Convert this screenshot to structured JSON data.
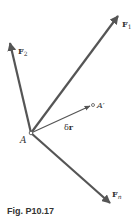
{
  "figure": {
    "caption": "Fig. P10.17",
    "colors": {
      "arrow": "#555555",
      "text": "#333333"
    },
    "point_A": {
      "label": "A",
      "x": 31,
      "y": 133
    },
    "point_A_prime": {
      "label": "A′",
      "x": 93,
      "y": 105
    },
    "vectors": [
      {
        "id": "F1",
        "label": "F",
        "sub": "1",
        "tip": [
          118,
          16
        ]
      },
      {
        "id": "F2",
        "label": "F",
        "sub": "2",
        "tip": [
          10,
          43
        ]
      },
      {
        "id": "Fn",
        "label": "F",
        "sub": "n",
        "tip": [
          110,
          203
        ]
      },
      {
        "id": "dr",
        "label": "δr",
        "tip": [
          91,
          106
        ]
      }
    ]
  }
}
